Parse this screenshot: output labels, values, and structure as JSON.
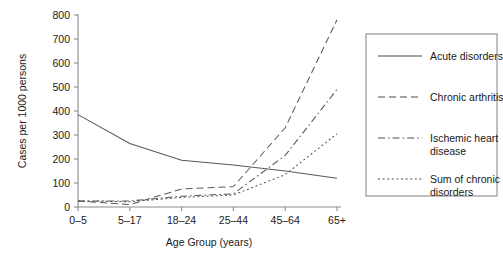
{
  "chart_data": {
    "type": "line",
    "title": "",
    "xlabel": "Age Group (years)",
    "ylabel": "Cases per 1000 persons",
    "categories": [
      "0–5",
      "5–17",
      "18–24",
      "25–44",
      "45–64",
      "65+"
    ],
    "ylim": [
      0,
      800
    ],
    "yticks": [
      0,
      100,
      200,
      300,
      400,
      500,
      600,
      700,
      800
    ],
    "ytick_labels": [
      "0",
      "100",
      "200",
      "300",
      "400",
      "500",
      "600",
      "700",
      "800"
    ],
    "grid": false,
    "legend_position": "right-outside",
    "series": [
      {
        "name": "Acute disorders",
        "dash": "solid",
        "values": [
          385,
          265,
          195,
          175,
          150,
          120
        ]
      },
      {
        "name": "Chronic arthritis",
        "dash": "dashed",
        "values": [
          25,
          10,
          75,
          85,
          330,
          780
        ]
      },
      {
        "name": "Ischemic heart disease",
        "dash": "dashdot",
        "values": [
          25,
          25,
          45,
          55,
          215,
          490
        ]
      },
      {
        "name": "Sum of chronic disorders",
        "dash": "dotted",
        "values": [
          25,
          22,
          40,
          50,
          135,
          305
        ]
      }
    ]
  },
  "legend": {
    "entries": [
      {
        "label": "Acute disorders",
        "dash": "solid"
      },
      {
        "label": "Chronic arthritis",
        "dash": "dashed"
      },
      {
        "label": "Ischemic heart disease",
        "dash": "dashdot"
      },
      {
        "label": "Sum of chronic disorders",
        "dash": "dotted"
      }
    ]
  }
}
